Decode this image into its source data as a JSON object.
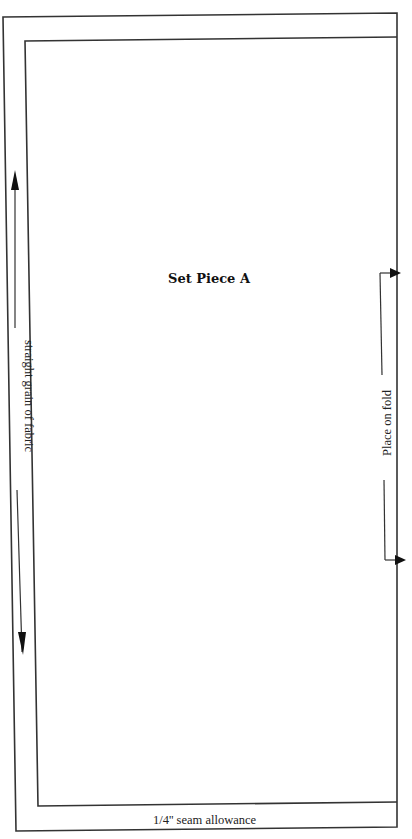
{
  "pattern": {
    "piece_title": "Set Piece A",
    "grain_label": "straight grain of fabric",
    "fold_label": "Place on fold",
    "seam_label": "1/4'' seam allowance"
  },
  "colors": {
    "line": "#333333",
    "background": "#ffffff"
  },
  "icons": {
    "grain_arrow": "double-headed-vertical-arrow",
    "fold_arrow": "bracket-arrow-to-fold"
  }
}
